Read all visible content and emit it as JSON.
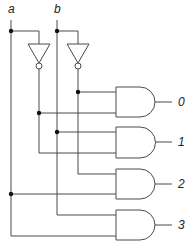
{
  "diagram": {
    "type": "2-to-4 decoder logic circuit",
    "inputs": [
      {
        "label": "a"
      },
      {
        "label": "b"
      }
    ],
    "outputs": [
      {
        "label": "0",
        "expression": "NOT a AND NOT b"
      },
      {
        "label": "1",
        "expression": "NOT a AND b"
      },
      {
        "label": "2",
        "expression": "a AND NOT b"
      },
      {
        "label": "3",
        "expression": "a AND b"
      }
    ],
    "gates": {
      "inverters": 2,
      "and_gates": 4
    },
    "colors": {
      "wire": "#4a4a4a",
      "junction": "#111111",
      "background": "#ffffff"
    }
  }
}
